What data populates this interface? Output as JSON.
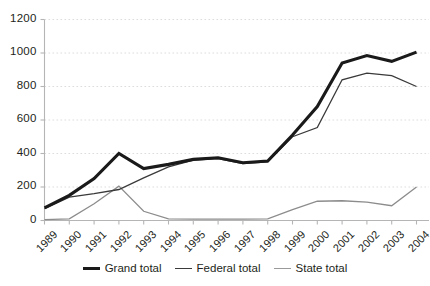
{
  "chart_data": {
    "type": "line",
    "title": "",
    "xlabel": "",
    "ylabel": "",
    "ylim": [
      0,
      1200
    ],
    "yticks": [
      0,
      200,
      400,
      600,
      800,
      1000,
      1200
    ],
    "grid": true,
    "legend_position": "bottom",
    "categories": [
      "1989",
      "1990",
      "1991",
      "1992",
      "1993",
      "1994",
      "1995",
      "1996",
      "1997",
      "1998",
      "1999",
      "2000",
      "2001",
      "2002",
      "2003",
      "2004"
    ],
    "series": [
      {
        "name": "Grand total",
        "color": "#1a1a1a",
        "width": 3.1,
        "values": [
          75,
          150,
          250,
          400,
          310,
          335,
          365,
          375,
          345,
          355,
          510,
          680,
          940,
          985,
          950,
          1005
        ]
      },
      {
        "name": "Federal total",
        "color": "#3a3a3a",
        "width": 1.3,
        "values": [
          70,
          140,
          160,
          185,
          255,
          320,
          360,
          370,
          340,
          350,
          500,
          555,
          840,
          880,
          865,
          800
        ]
      },
      {
        "name": "State total",
        "color": "#8c8c8c",
        "width": 1.3,
        "values": [
          5,
          10,
          100,
          205,
          55,
          10,
          8,
          8,
          8,
          10,
          65,
          115,
          118,
          110,
          88,
          200
        ]
      }
    ]
  },
  "axes": {
    "y_tick_labels": [
      "1200",
      "1000",
      "800",
      "600",
      "400",
      "200",
      "0"
    ],
    "x_tick_labels": [
      "1989",
      "1990",
      "1991",
      "1992",
      "1993",
      "1994",
      "1995",
      "1996",
      "1997",
      "1998",
      "1999",
      "2000",
      "2001",
      "2002",
      "2003",
      "2004"
    ]
  },
  "legend": {
    "items": [
      {
        "label": "Grand total",
        "color": "#1a1a1a",
        "thickness": "3px"
      },
      {
        "label": "Federal total",
        "color": "#3a3a3a",
        "thickness": "1.5px"
      },
      {
        "label": "State total",
        "color": "#9a9a9a",
        "thickness": "1.5px"
      }
    ]
  },
  "colors": {
    "axis": "#b5b5b5",
    "grid": "#d9d9d9",
    "text": "#231f20",
    "background": "#ffffff"
  }
}
